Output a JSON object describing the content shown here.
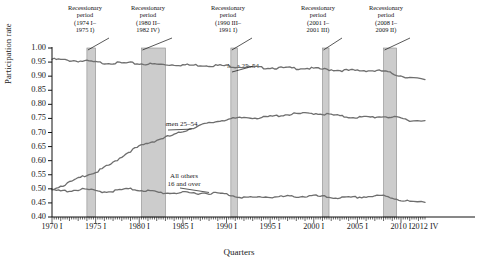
{
  "chart_data": {
    "type": "line",
    "title": "",
    "xlabel": "Quarters",
    "ylabel": "Participation rate",
    "ylim": [
      0.4,
      1.0
    ],
    "ytick_labels": [
      "1.00",
      "0.95",
      "0.90",
      "0.85",
      "0.80",
      "0.75",
      "0.70",
      "0.65",
      "0.60",
      "0.55",
      "0.50",
      "0.45",
      "0.40"
    ],
    "ytick_values": [
      1.0,
      0.95,
      0.9,
      0.85,
      0.8,
      0.75,
      0.7,
      0.65,
      0.6,
      0.55,
      0.5,
      0.45,
      0.4
    ],
    "xtick_labels": [
      "1970 I",
      "1975 I",
      "1980 I",
      "1985 I",
      "1990 I",
      "1995 I",
      "2000 I",
      "2005 I",
      "2010 I",
      "2012 IV"
    ],
    "xtick_values": [
      1970.0,
      1975.0,
      1980.0,
      1985.0,
      1990.0,
      1995.0,
      2000.0,
      2005.0,
      2010.0,
      2012.75
    ],
    "xlim": [
      1970.0,
      2012.75
    ],
    "grid": false,
    "legend": "inline-labels",
    "line_color": "#6e6e6e",
    "band_color": "#cccccc",
    "series": [
      {
        "name": "Men 25–54",
        "label_position": "upper-right",
        "x": [
          1970,
          1971,
          1972,
          1973,
          1974,
          1975,
          1976,
          1977,
          1978,
          1979,
          1980,
          1981,
          1982,
          1983,
          1984,
          1985,
          1986,
          1987,
          1988,
          1989,
          1990,
          1991,
          1992,
          1993,
          1994,
          1995,
          1996,
          1997,
          1998,
          1999,
          2000,
          2001,
          2002,
          2003,
          2004,
          2005,
          2006,
          2007,
          2008,
          2009,
          2010,
          2011,
          2012.75
        ],
        "values": [
          0.962,
          0.96,
          0.958,
          0.956,
          0.955,
          0.951,
          0.949,
          0.949,
          0.948,
          0.948,
          0.946,
          0.945,
          0.944,
          0.943,
          0.943,
          0.942,
          0.941,
          0.941,
          0.94,
          0.94,
          0.939,
          0.936,
          0.935,
          0.934,
          0.932,
          0.932,
          0.931,
          0.931,
          0.93,
          0.93,
          0.929,
          0.927,
          0.925,
          0.923,
          0.922,
          0.922,
          0.922,
          0.921,
          0.92,
          0.911,
          0.903,
          0.897,
          0.888
        ]
      },
      {
        "name": "Women 25–54",
        "label_position": "middle",
        "x": [
          1970,
          1971,
          1972,
          1973,
          1974,
          1975,
          1976,
          1977,
          1978,
          1979,
          1980,
          1981,
          1982,
          1983,
          1984,
          1985,
          1986,
          1987,
          1988,
          1989,
          1990,
          1991,
          1992,
          1993,
          1994,
          1995,
          1996,
          1997,
          1998,
          1999,
          2000,
          2001,
          2002,
          2003,
          2004,
          2005,
          2006,
          2007,
          2008,
          2009,
          2010,
          2011,
          2012.75
        ],
        "values": [
          0.502,
          0.512,
          0.524,
          0.538,
          0.553,
          0.56,
          0.577,
          0.594,
          0.617,
          0.637,
          0.652,
          0.664,
          0.675,
          0.685,
          0.693,
          0.706,
          0.718,
          0.727,
          0.735,
          0.742,
          0.749,
          0.751,
          0.755,
          0.755,
          0.754,
          0.758,
          0.762,
          0.766,
          0.768,
          0.769,
          0.77,
          0.768,
          0.765,
          0.76,
          0.757,
          0.756,
          0.756,
          0.757,
          0.759,
          0.756,
          0.752,
          0.746,
          0.742
        ]
      },
      {
        "name": "All others\n16 and over",
        "label_position": "lower-middle",
        "x": [
          1970,
          1971,
          1972,
          1973,
          1974,
          1975,
          1976,
          1977,
          1978,
          1979,
          1980,
          1981,
          1982,
          1983,
          1984,
          1985,
          1986,
          1987,
          1988,
          1989,
          1990,
          1991,
          1992,
          1993,
          1994,
          1995,
          1996,
          1997,
          1998,
          1999,
          2000,
          2001,
          2002,
          2003,
          2004,
          2005,
          2006,
          2007,
          2008,
          2009,
          2010,
          2011,
          2012.75
        ],
        "values": [
          0.497,
          0.494,
          0.495,
          0.499,
          0.5,
          0.494,
          0.492,
          0.494,
          0.499,
          0.501,
          0.498,
          0.495,
          0.49,
          0.487,
          0.488,
          0.488,
          0.487,
          0.487,
          0.487,
          0.486,
          0.483,
          0.476,
          0.472,
          0.47,
          0.474,
          0.473,
          0.473,
          0.475,
          0.475,
          0.475,
          0.477,
          0.474,
          0.471,
          0.47,
          0.47,
          0.472,
          0.474,
          0.476,
          0.477,
          0.47,
          0.462,
          0.457,
          0.452
        ]
      }
    ],
    "recession_bands": [
      {
        "label": "Recessionary\nperiod\n(1974 I–\n1975 I)",
        "start": 1974.0,
        "end": 1975.0
      },
      {
        "label": "Recessionary\nperiod\n(1980 II–\n1982 IV)",
        "start": 1980.25,
        "end": 1983.0
      },
      {
        "label": "Recessionary\nperiod\n(1990 III–\n1991 I)",
        "start": 1990.5,
        "end": 1991.25
      },
      {
        "label": "Recessionary\nperiod\n(2001 I–\n2001 III)",
        "start": 2001.0,
        "end": 2001.75
      },
      {
        "label": "Recessionary\nperiod\n(2008 I–\n2009 II)",
        "start": 2008.0,
        "end": 2009.5
      }
    ]
  }
}
